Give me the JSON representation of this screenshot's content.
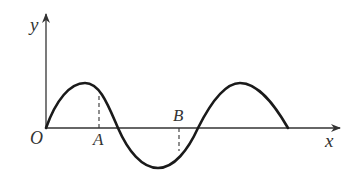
{
  "diagram": {
    "type": "wave-graph",
    "colors": {
      "stroke": "#1a1a1a",
      "axis": "#333333",
      "label": "#333333"
    },
    "axes": {
      "x_label": "x",
      "y_label": "y",
      "origin_label": "O"
    },
    "points": [
      {
        "label": "A",
        "position": "below-axis",
        "dashed_to": "curve-above"
      },
      {
        "label": "B",
        "position": "above-axis",
        "dashed_to": "curve-below"
      }
    ],
    "curve": {
      "description": "sinusoid starting at origin: crest, trough, crest, ending on the x-axis (1.5 wavelengths)"
    }
  }
}
